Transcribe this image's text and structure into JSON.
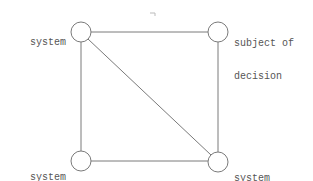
{
  "diagram": {
    "nodes": [
      {
        "id": "system",
        "label_lines": [
          "system"
        ],
        "x": 81,
        "y": 32
      },
      {
        "id": "subject-of-decision",
        "label_lines": [
          "subject of",
          "decision"
        ],
        "x": 218,
        "y": 32
      },
      {
        "id": "system-designer",
        "label_lines": [
          "system",
          "designer"
        ],
        "x": 81,
        "y": 161
      },
      {
        "id": "system-user",
        "label_lines": [
          "system",
          "user"
        ],
        "x": 218,
        "y": 162
      }
    ],
    "edges": [
      [
        "system",
        "subject-of-decision"
      ],
      [
        "system",
        "system-designer"
      ],
      [
        "system",
        "system-user"
      ],
      [
        "subject-of-decision",
        "system-user"
      ],
      [
        "system-designer",
        "system-user"
      ]
    ],
    "colors": {
      "line": "#777777",
      "text": "#555555",
      "background": "#ffffff"
    }
  }
}
